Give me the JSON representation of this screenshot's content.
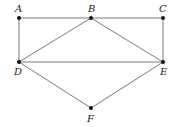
{
  "diagram": {
    "type": "graph",
    "nodes": [
      {
        "id": "A",
        "label": "A",
        "x": 19,
        "y": 18,
        "lx": 15,
        "ly": 12
      },
      {
        "id": "B",
        "label": "B",
        "x": 91,
        "y": 18,
        "lx": 88,
        "ly": 12
      },
      {
        "id": "C",
        "label": "C",
        "x": 163,
        "y": 18,
        "lx": 159,
        "ly": 12
      },
      {
        "id": "D",
        "label": "D",
        "x": 19,
        "y": 62,
        "lx": 14,
        "ly": 75
      },
      {
        "id": "E",
        "label": "E",
        "x": 163,
        "y": 62,
        "lx": 160,
        "ly": 75
      },
      {
        "id": "F",
        "label": "F",
        "x": 91,
        "y": 108,
        "lx": 87,
        "ly": 122
      }
    ],
    "edges": [
      [
        "A",
        "B"
      ],
      [
        "B",
        "C"
      ],
      [
        "A",
        "D"
      ],
      [
        "C",
        "E"
      ],
      [
        "B",
        "D"
      ],
      [
        "B",
        "E"
      ],
      [
        "D",
        "E"
      ],
      [
        "D",
        "F"
      ],
      [
        "E",
        "F"
      ]
    ]
  }
}
